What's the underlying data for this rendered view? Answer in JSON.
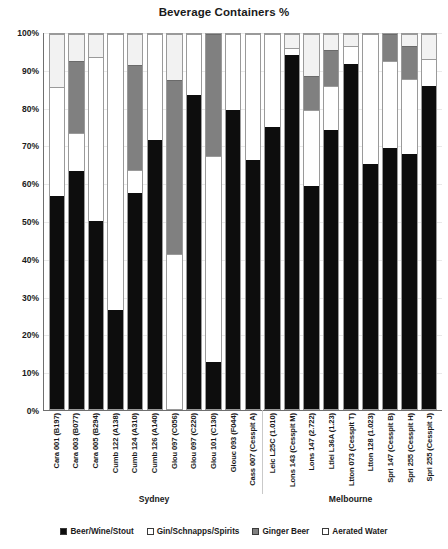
{
  "chart_data": {
    "type": "bar",
    "subtype": "stacked-percentage-column",
    "title": "Beverage Containers %",
    "xlabel": "",
    "ylabel": "",
    "ylim": [
      0,
      100
    ],
    "ytick_labels": [
      "0%",
      "10%",
      "20%",
      "30%",
      "40%",
      "50%",
      "60%",
      "70%",
      "80%",
      "90%",
      "100%"
    ],
    "ytick_values": [
      0,
      10,
      20,
      30,
      40,
      50,
      60,
      70,
      80,
      90,
      100
    ],
    "grid": true,
    "legend_position": "bottom",
    "categories": [
      "Cara 001 (B197)",
      "Cara 003 (B077)",
      "Cara 005 (B294)",
      "Cumb 122 (A138)",
      "Cumb 124 (A310)",
      "Cumb 126 (A140)",
      "Glou 097 (C056)",
      "Glou 097 (C220)",
      "Glou 101 (C130)",
      "Glouc 093 (F044)",
      "Cass 007 (Cesspit A)",
      "Leic L25C (1.010)",
      "Lons 143 (Cesspit M)",
      "Lons 147 (2.722)",
      "Ltlei L36A (1.23)",
      "Ltton 073 (Cesspit T)",
      "Ltton 128 (1.023)",
      "Spri 147 (Cesspit B)",
      "Spri 255 (Cesspit H)",
      "Spri 255 (Cesspit J)"
    ],
    "series": [
      {
        "name": "Beer/Wine/Stout",
        "color": "#0d0d0d",
        "values": [
          57,
          64,
          50.5,
          26.5,
          58,
          72,
          0,
          84,
          12.5,
          80,
          66.5,
          75.5,
          95,
          60,
          75,
          92.5,
          65.5,
          70,
          68.5,
          86.5
        ]
      },
      {
        "name": "Gin/Schnapps/Spirits",
        "color": "#ffffff",
        "values": [
          29,
          10,
          43.5,
          73.5,
          6,
          28,
          41.5,
          16,
          55,
          20,
          33.5,
          24.5,
          1.5,
          20,
          11.5,
          4.5,
          34.5,
          23,
          20,
          7
        ]
      },
      {
        "name": "Ginger Beer",
        "color": "#808080",
        "values": [
          0,
          19,
          0,
          0,
          28,
          0,
          46.5,
          0,
          32.5,
          0,
          0,
          0,
          0,
          9,
          9.5,
          0,
          0,
          7,
          8.5,
          0
        ]
      },
      {
        "name": "Aerated Water",
        "color": "#f2f2f2",
        "values": [
          14,
          7,
          6,
          0,
          8,
          0,
          12,
          0,
          0,
          0,
          0,
          0,
          3.5,
          11,
          4,
          3,
          0,
          0,
          3,
          6.5
        ]
      }
    ],
    "groups": [
      {
        "label": "Sydney",
        "start_index": 0,
        "end_index": 10
      },
      {
        "label": "Melbourne",
        "start_index": 11,
        "end_index": 19
      }
    ]
  },
  "legend": {
    "items": [
      {
        "label": "Beer/Wine/Stout",
        "swatch": "swatch-beer"
      },
      {
        "label": "Gin/Schnapps/Spirits",
        "swatch": "swatch-gin"
      },
      {
        "label": "Ginger Beer",
        "swatch": "swatch-ginger"
      },
      {
        "label": "Aerated Water",
        "swatch": "swatch-aerated"
      }
    ]
  }
}
